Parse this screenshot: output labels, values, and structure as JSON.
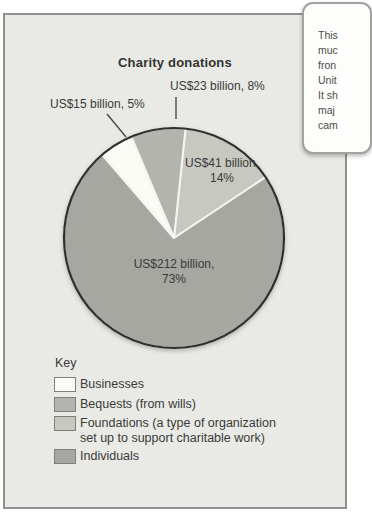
{
  "callout": {
    "visible_text_lines": [
      "This",
      "muc",
      "fron",
      "Unit",
      "It sh",
      "maj",
      "cam"
    ]
  },
  "chart": {
    "title": "Charity donations",
    "pie_labels": {
      "bequests": {
        "line1": "US$23 billion, 8%"
      },
      "businesses": {
        "line1": "US$15 billion, 5%"
      },
      "foundations": {
        "line1": "US$41 billion,",
        "line2": "14%"
      },
      "individuals": {
        "line1": "US$212 billion,",
        "line2": "73%"
      }
    }
  },
  "legend": {
    "heading": "Key",
    "items": [
      {
        "line1": "Businesses",
        "color": "#fbfbf6"
      },
      {
        "line1": "Bequests (from wills)",
        "color": "#b2b4ad"
      },
      {
        "line1": "Foundations (a type of organization",
        "line2": "set up to support charitable work)",
        "color": "#c7c9c1"
      },
      {
        "line1": "Individuals",
        "color": "#a5a7a0"
      }
    ]
  },
  "chart_data": {
    "type": "pie",
    "title": "Charity donations",
    "unit": "US$ billions",
    "slices": [
      {
        "label": "Foundations (a type of organization set up to support charitable work)",
        "value": 41,
        "percent": 14,
        "color": "#c7c9c1"
      },
      {
        "label": "Individuals",
        "value": 212,
        "percent": 73,
        "color": "#a5a7a0"
      },
      {
        "label": "Businesses",
        "value": 15,
        "percent": 5,
        "color": "#fbfbf6"
      },
      {
        "label": "Bequests (from wills)",
        "value": 23,
        "percent": 8,
        "color": "#b2b4ad"
      }
    ],
    "start_angle_deg": 6,
    "direction": "clockwise",
    "outline_color": "#2f2f2d",
    "separator_color": "#f4f4f0",
    "leader_line_color": "#4a4a48",
    "legend_position": "bottom-left"
  }
}
